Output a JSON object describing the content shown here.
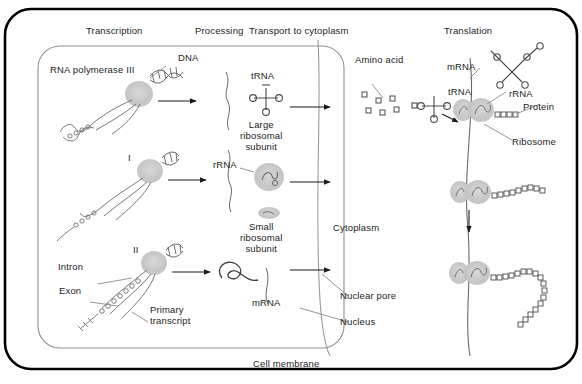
{
  "figure": {
    "title_hidden": "Gene expression: transcription, processing, transport and translation",
    "cell_membrane_label": "Cell membrane",
    "nucleus_label": "Nucleus",
    "nuclear_pore_label": "Nuclear pore",
    "cytoplasm_label": "Cytoplasm"
  },
  "stage_headers": [
    {
      "id": "transcription",
      "label": "Transcription"
    },
    {
      "id": "processing",
      "label": "Processing"
    },
    {
      "id": "transport",
      "label": "Transport to cytoplasm"
    },
    {
      "id": "translation",
      "label": "Translation"
    }
  ],
  "nucleus_rows": [
    {
      "id": "row-pol-iii",
      "polymerase_label": "RNA polymerase III",
      "dna_label": "DNA",
      "product_label": "tRNA",
      "secondary_label": "Large\nribosomal\nsubunit"
    },
    {
      "id": "row-pol-i",
      "polymerase_label": "I",
      "product_label": "rRNA",
      "secondary_label": "Small\nribosomal\nsubunit"
    },
    {
      "id": "row-pol-ii",
      "polymerase_label": "II",
      "intron_label": "Intron",
      "exon_label": "Exon",
      "primary_transcript_label": "Primary\ntranscript",
      "product_label": "mRNA"
    }
  ],
  "cytoplasm_items": [
    {
      "id": "amino-acid",
      "label": "Amino acid"
    },
    {
      "id": "trna-charged",
      "label": "tRNA"
    }
  ],
  "translation_items": [
    {
      "id": "mrna-strand",
      "label": "mRNA"
    },
    {
      "id": "rrna",
      "label": "rRNA"
    },
    {
      "id": "protein",
      "label": "Protein"
    },
    {
      "id": "ribosome",
      "label": "Ribosome"
    }
  ],
  "colors": {
    "membrane_stroke": "#000000",
    "nucleus_stroke": "#8d8d8d",
    "ink": "#4a4a4a",
    "blob_fill": "#c9c9c9",
    "text": "#1d1d1d"
  }
}
